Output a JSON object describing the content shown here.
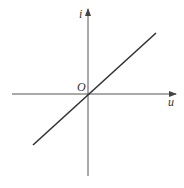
{
  "diagram": {
    "type": "linear-iv-characteristic",
    "axes": {
      "horizontal_label": "u",
      "vertical_label": "i",
      "origin_label": "O"
    },
    "line": {
      "description": "straight line through origin with positive slope",
      "color": "#333333"
    },
    "axis_color": "#555555"
  }
}
